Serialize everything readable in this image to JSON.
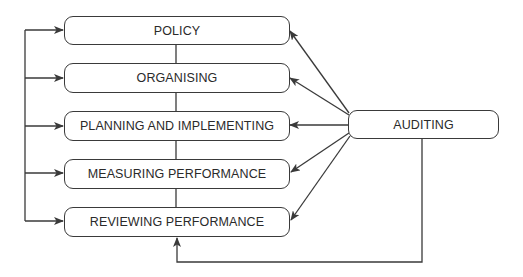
{
  "diagram": {
    "type": "flowchart",
    "stages": [
      {
        "id": "policy",
        "label": "POLICY"
      },
      {
        "id": "organising",
        "label": "ORGANISING"
      },
      {
        "id": "planning",
        "label": "PLANNING AND IMPLEMENTING"
      },
      {
        "id": "measuring",
        "label": "MEASURING PERFORMANCE"
      },
      {
        "id": "reviewing",
        "label": "REVIEWING PERFORMANCE"
      }
    ],
    "auditing": {
      "label": "AUDITING"
    },
    "edges": [
      {
        "from": "auditing",
        "to": "policy"
      },
      {
        "from": "auditing",
        "to": "organising"
      },
      {
        "from": "auditing",
        "to": "planning"
      },
      {
        "from": "auditing",
        "to": "measuring"
      },
      {
        "from": "auditing",
        "to": "reviewing"
      },
      {
        "from": "auditing",
        "to": "reviewing",
        "route": "bottom"
      },
      {
        "from": "feedback-loop",
        "to": "policy"
      },
      {
        "from": "feedback-loop",
        "to": "organising"
      },
      {
        "from": "feedback-loop",
        "to": "planning"
      },
      {
        "from": "feedback-loop",
        "to": "measuring"
      },
      {
        "from": "feedback-loop",
        "to": "reviewing"
      }
    ],
    "colors": {
      "line": "#3a3a3a",
      "text": "#2a2a2a",
      "background": "#ffffff"
    }
  }
}
